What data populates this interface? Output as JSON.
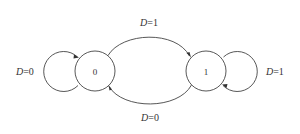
{
  "diagram": {
    "type": "state-transition-diagram",
    "states": [
      {
        "id": "0",
        "label": "0"
      },
      {
        "id": "1",
        "label": "1"
      }
    ],
    "transitions": [
      {
        "from": "0",
        "to": "0",
        "label": "D=0",
        "var": "D",
        "eq": "=0"
      },
      {
        "from": "0",
        "to": "1",
        "label": "D=1",
        "var": "D",
        "eq": "=1"
      },
      {
        "from": "1",
        "to": "0",
        "label": "D=0",
        "var": "D",
        "eq": "=0"
      },
      {
        "from": "1",
        "to": "1",
        "label": "D=1",
        "var": "D",
        "eq": "=1"
      }
    ],
    "colors": {
      "stroke": "#444444",
      "text": "#333333",
      "background": "#ffffff"
    }
  }
}
